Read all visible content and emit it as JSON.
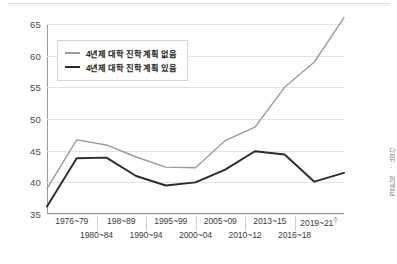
{
  "chart_data": {
    "type": "line",
    "title": "",
    "xlabel": "",
    "ylabel": "",
    "ylim": [
      35,
      65
    ],
    "yticks": [
      35,
      40,
      45,
      50,
      55,
      60,
      65
    ],
    "grid": true,
    "legend_position": "top-left",
    "categories": [
      "1976~79",
      "1980~84",
      "198~89",
      "1990~94",
      "1995~99",
      "2000~04",
      "2005~09",
      "2010~12",
      "2013~15",
      "2016~18",
      "2019~21"
    ],
    "series": [
      {
        "name": "4년제 대학 진학 계획 없음",
        "color": "#9b9b9b",
        "values": [
          39.0,
          46.7,
          45.9,
          44.0,
          42.4,
          42.3,
          46.6,
          48.7,
          55.0,
          59.0,
          66.0
        ]
      },
      {
        "name": "4년제 대학 진학 계획 있음",
        "color": "#2b2b2b",
        "values": [
          36.2,
          43.8,
          43.9,
          41.0,
          39.5,
          40.0,
          42.0,
          44.9,
          44.4,
          40.1,
          41.5
        ]
      }
    ]
  },
  "axis": {
    "x_labels_upper": [
      "1976~79",
      "198~89",
      "1995~99",
      "2005~09",
      "2013~15",
      "2019~21"
    ],
    "x_labels_lower": [
      "1980~84",
      "1990~94",
      "2000~04",
      "2010~12",
      "2016~18"
    ],
    "x_last_superscript": "주",
    "y_tick_labels": [
      "65",
      "60",
      "55",
      "50",
      "45",
      "40",
      "35"
    ]
  },
  "legend": {
    "items": [
      {
        "label": "4년제 대학 진학 계획 없음"
      },
      {
        "label": "4년제 대학 진학 계획 있음"
      }
    ]
  },
  "side_note": "단위: 퍼센트"
}
